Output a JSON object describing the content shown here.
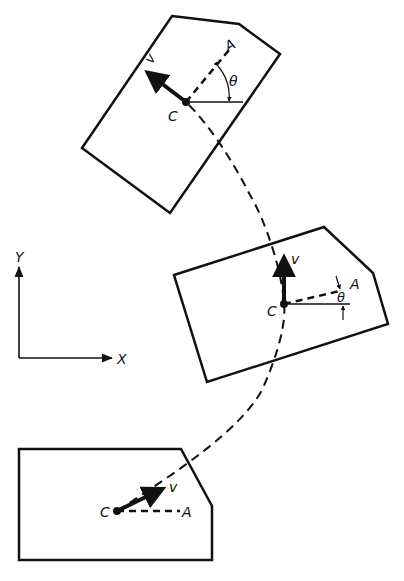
{
  "diagram": {
    "title": "",
    "colors": {
      "ink": "#111111",
      "background": "#ffffff"
    },
    "axes": {
      "x_label": "X",
      "y_label": "Y"
    },
    "path": {
      "style": "dashed",
      "description": "trajectory of center C"
    },
    "bodies": [
      {
        "id": "top",
        "center_label": "C",
        "point_label": "A",
        "velocity_label": "v",
        "angle_label": "θ"
      },
      {
        "id": "middle",
        "center_label": "C",
        "point_label": "A",
        "velocity_label": "v",
        "angle_label": "θ"
      },
      {
        "id": "bottom",
        "center_label": "C",
        "point_label": "A",
        "velocity_label": "v"
      }
    ]
  }
}
